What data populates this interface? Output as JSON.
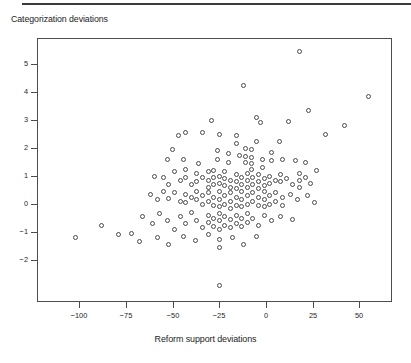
{
  "figure": {
    "title": "Categorization deviations",
    "xaxis_title": "Reform support deviations"
  },
  "chart_data": {
    "type": "scatter",
    "title": "Categorization deviations",
    "xlabel": "Reform support deviations",
    "ylabel": "Categorization deviations",
    "xlim": [
      -115,
      68
    ],
    "ylim": [
      -3.2,
      6.0
    ],
    "grid": false,
    "legend": null,
    "marker": "open-circle",
    "marker_color": "#4a4a4a",
    "xticks": [
      -100,
      -75,
      -50,
      -25,
      0,
      25,
      50
    ],
    "xticklabels": [
      "−100",
      "−75",
      "−50",
      "−25",
      "0",
      "25",
      "50"
    ],
    "yticks": [
      5,
      4,
      3,
      2,
      1,
      0,
      -1,
      -2
    ],
    "yticklabels": [
      "5",
      "4",
      "3",
      "2",
      "1",
      "0",
      "−1",
      "−2"
    ],
    "n_points": 187,
    "points": [
      [
        18.0,
        5.45
      ],
      [
        55.0,
        3.85
      ],
      [
        -12.0,
        4.25
      ],
      [
        23.0,
        3.35
      ],
      [
        -5.0,
        3.1
      ],
      [
        12.0,
        2.95
      ],
      [
        -3.0,
        2.9
      ],
      [
        -29.0,
        3.0
      ],
      [
        -34.0,
        2.55
      ],
      [
        -25.0,
        2.5
      ],
      [
        -43.0,
        2.55
      ],
      [
        -47.0,
        2.45
      ],
      [
        42.0,
        2.8
      ],
      [
        32.0,
        2.5
      ],
      [
        -16.0,
        2.45
      ],
      [
        -16.0,
        2.15
      ],
      [
        -5.0,
        2.25
      ],
      [
        7.0,
        2.25
      ],
      [
        -50.0,
        1.95
      ],
      [
        -44.0,
        1.6
      ],
      [
        -53.0,
        1.6
      ],
      [
        -36.0,
        1.45
      ],
      [
        -26.0,
        1.9
      ],
      [
        -26.0,
        1.6
      ],
      [
        -20.0,
        1.8
      ],
      [
        -20.0,
        1.5
      ],
      [
        -14.0,
        1.75
      ],
      [
        -11.0,
        2.0
      ],
      [
        -11.0,
        1.7
      ],
      [
        -11.0,
        1.5
      ],
      [
        -8.0,
        1.95
      ],
      [
        -8.0,
        1.65
      ],
      [
        -8.0,
        1.45
      ],
      [
        -8.0,
        1.25
      ],
      [
        -2.0,
        1.6
      ],
      [
        -2.0,
        1.3
      ],
      [
        3.0,
        1.85
      ],
      [
        3.0,
        1.55
      ],
      [
        9.0,
        1.6
      ],
      [
        16.0,
        1.55
      ],
      [
        21.0,
        1.5
      ],
      [
        27.0,
        1.2
      ],
      [
        -60.0,
        1.0
      ],
      [
        -55.0,
        0.95
      ],
      [
        -52.0,
        0.7
      ],
      [
        -49.0,
        1.15
      ],
      [
        -46.0,
        0.85
      ],
      [
        -43.0,
        1.25
      ],
      [
        -43.0,
        0.95
      ],
      [
        -40.0,
        0.7
      ],
      [
        -37.0,
        1.1
      ],
      [
        -37.0,
        0.8
      ],
      [
        -34.0,
        0.95
      ],
      [
        -31.0,
        1.15
      ],
      [
        -31.0,
        0.85
      ],
      [
        -31.0,
        0.6
      ],
      [
        -28.0,
        1.2
      ],
      [
        -28.0,
        0.95
      ],
      [
        -28.0,
        0.7
      ],
      [
        -25.0,
        1.0
      ],
      [
        -25.0,
        0.75
      ],
      [
        -22.0,
        1.15
      ],
      [
        -22.0,
        0.9
      ],
      [
        -22.0,
        0.65
      ],
      [
        -19.0,
        0.85
      ],
      [
        -19.0,
        0.6
      ],
      [
        -16.0,
        1.05
      ],
      [
        -16.0,
        0.8
      ],
      [
        -16.0,
        0.55
      ],
      [
        -13.0,
        0.95
      ],
      [
        -13.0,
        0.7
      ],
      [
        -10.0,
        1.1
      ],
      [
        -10.0,
        0.85
      ],
      [
        -10.0,
        0.6
      ],
      [
        -7.0,
        0.95
      ],
      [
        -7.0,
        0.7
      ],
      [
        -4.0,
        1.05
      ],
      [
        -4.0,
        0.8
      ],
      [
        -4.0,
        0.55
      ],
      [
        -1.0,
        0.9
      ],
      [
        -1.0,
        0.65
      ],
      [
        2.0,
        1.0
      ],
      [
        2.0,
        0.75
      ],
      [
        5.0,
        0.85
      ],
      [
        8.0,
        1.05
      ],
      [
        8.0,
        0.8
      ],
      [
        11.0,
        0.9
      ],
      [
        14.0,
        0.7
      ],
      [
        18.0,
        1.1
      ],
      [
        18.0,
        0.85
      ],
      [
        18.0,
        0.6
      ],
      [
        21.0,
        0.95
      ],
      [
        24.0,
        0.75
      ],
      [
        -62.0,
        0.35
      ],
      [
        -58.0,
        0.15
      ],
      [
        -55.0,
        0.45
      ],
      [
        -52.0,
        0.2
      ],
      [
        -49.0,
        0.4
      ],
      [
        -46.0,
        0.1
      ],
      [
        -43.0,
        0.35
      ],
      [
        -43.0,
        0.05
      ],
      [
        -40.0,
        0.25
      ],
      [
        -37.0,
        0.45
      ],
      [
        -37.0,
        0.15
      ],
      [
        -34.0,
        0.3
      ],
      [
        -34.0,
        0.0
      ],
      [
        -31.0,
        0.4
      ],
      [
        -31.0,
        0.1
      ],
      [
        -28.0,
        0.25
      ],
      [
        -28.0,
        -0.05
      ],
      [
        -25.0,
        0.45
      ],
      [
        -25.0,
        0.15
      ],
      [
        -25.0,
        -0.1
      ],
      [
        -22.0,
        0.3
      ],
      [
        -22.0,
        0.0
      ],
      [
        -19.0,
        0.4
      ],
      [
        -19.0,
        0.1
      ],
      [
        -19.0,
        -0.15
      ],
      [
        -16.0,
        0.25
      ],
      [
        -16.0,
        -0.05
      ],
      [
        -13.0,
        0.45
      ],
      [
        -13.0,
        0.15
      ],
      [
        -13.0,
        -0.1
      ],
      [
        -10.0,
        0.3
      ],
      [
        -10.0,
        0.0
      ],
      [
        -7.0,
        0.4
      ],
      [
        -7.0,
        0.1
      ],
      [
        -4.0,
        0.25
      ],
      [
        -4.0,
        -0.05
      ],
      [
        -1.0,
        0.45
      ],
      [
        -1.0,
        0.15
      ],
      [
        -1.0,
        -0.1
      ],
      [
        2.0,
        0.3
      ],
      [
        2.0,
        0.0
      ],
      [
        5.0,
        0.4
      ],
      [
        5.0,
        0.1
      ],
      [
        9.0,
        0.25
      ],
      [
        9.0,
        -0.05
      ],
      [
        13.0,
        0.35
      ],
      [
        17.0,
        0.15
      ],
      [
        22.0,
        0.3
      ],
      [
        26.0,
        0.05
      ],
      [
        -66.0,
        -0.45
      ],
      [
        -61.0,
        -0.7
      ],
      [
        -57.0,
        -0.35
      ],
      [
        -53.0,
        -0.6
      ],
      [
        -49.0,
        -0.9
      ],
      [
        -46.0,
        -0.45
      ],
      [
        -43.0,
        -0.7
      ],
      [
        -40.0,
        -0.3
      ],
      [
        -37.0,
        -0.6
      ],
      [
        -34.0,
        -0.85
      ],
      [
        -31.0,
        -0.4
      ],
      [
        -31.0,
        -0.65
      ],
      [
        -28.0,
        -0.5
      ],
      [
        -28.0,
        -0.8
      ],
      [
        -25.0,
        -0.35
      ],
      [
        -25.0,
        -0.6
      ],
      [
        -25.0,
        -0.9
      ],
      [
        -22.0,
        -0.45
      ],
      [
        -22.0,
        -0.75
      ],
      [
        -19.0,
        -0.55
      ],
      [
        -19.0,
        -0.85
      ],
      [
        -16.0,
        -0.4
      ],
      [
        -16.0,
        -0.7
      ],
      [
        -13.0,
        -0.5
      ],
      [
        -13.0,
        -0.8
      ],
      [
        -10.0,
        -0.35
      ],
      [
        -10.0,
        -0.65
      ],
      [
        -7.0,
        -0.5
      ],
      [
        -4.0,
        -0.75
      ],
      [
        -1.0,
        -0.4
      ],
      [
        3.0,
        -0.6
      ],
      [
        8.0,
        -0.45
      ],
      [
        14.0,
        -0.55
      ],
      [
        -102.0,
        -1.2
      ],
      [
        -88.0,
        -0.75
      ],
      [
        -79.0,
        -1.1
      ],
      [
        -72.0,
        -1.05
      ],
      [
        -68.0,
        -1.35
      ],
      [
        -58.0,
        -1.2
      ],
      [
        -52.0,
        -1.45
      ],
      [
        -44.0,
        -1.15
      ],
      [
        -38.0,
        -1.3
      ],
      [
        -31.0,
        -1.1
      ],
      [
        -25.0,
        -1.25
      ],
      [
        -25.0,
        -1.55
      ],
      [
        -18.0,
        -1.2
      ],
      [
        -12.0,
        -1.45
      ],
      [
        -5.0,
        -1.15
      ],
      [
        -25.0,
        -2.9
      ]
    ]
  }
}
